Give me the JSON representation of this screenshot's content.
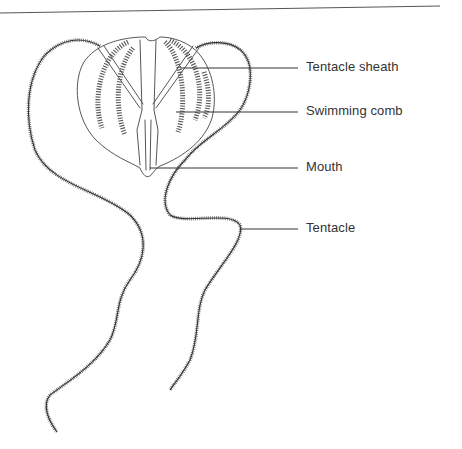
{
  "figure": {
    "labels": [
      {
        "id": "tentacle-sheath",
        "text": "Tentacle sheath"
      },
      {
        "id": "swimming-comb",
        "text": "Swimming comb"
      },
      {
        "id": "mouth",
        "text": "Mouth"
      },
      {
        "id": "tentacle",
        "text": "Tentacle"
      }
    ],
    "colors": {
      "ink": "#444444",
      "text": "#333333",
      "background": "#ffffff"
    }
  }
}
